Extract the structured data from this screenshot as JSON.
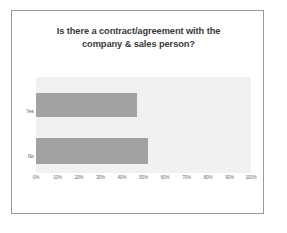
{
  "slide": {
    "background_color": "#ffffff",
    "border_color": "#9b9b9b"
  },
  "chart_data": {
    "type": "bar",
    "orientation": "horizontal",
    "title": "Is there a contract/agreement with the company & sales person?",
    "title_lines": [
      "Is there a contract/agreement with the",
      "company & sales person?"
    ],
    "categories": [
      "Yes",
      "No"
    ],
    "values": [
      47,
      52
    ],
    "value_unit": "%",
    "xlabel": "",
    "ylabel": "",
    "xlim": [
      0,
      100
    ],
    "xticks": [
      0,
      10,
      20,
      30,
      40,
      50,
      60,
      70,
      80,
      90,
      100
    ],
    "xtick_labels": [
      "0%",
      "10%",
      "20%",
      "30%",
      "40%",
      "50%",
      "60%",
      "70%",
      "80%",
      "90%",
      "100%"
    ],
    "grid": false,
    "legend": false,
    "bar_color": "#a2a2a2",
    "plot_background_color": "#f1f1f1",
    "title_color": "#3a3a3a",
    "tick_label_color": "#6a6a6a",
    "category_label_color": "#4d4d4d"
  }
}
